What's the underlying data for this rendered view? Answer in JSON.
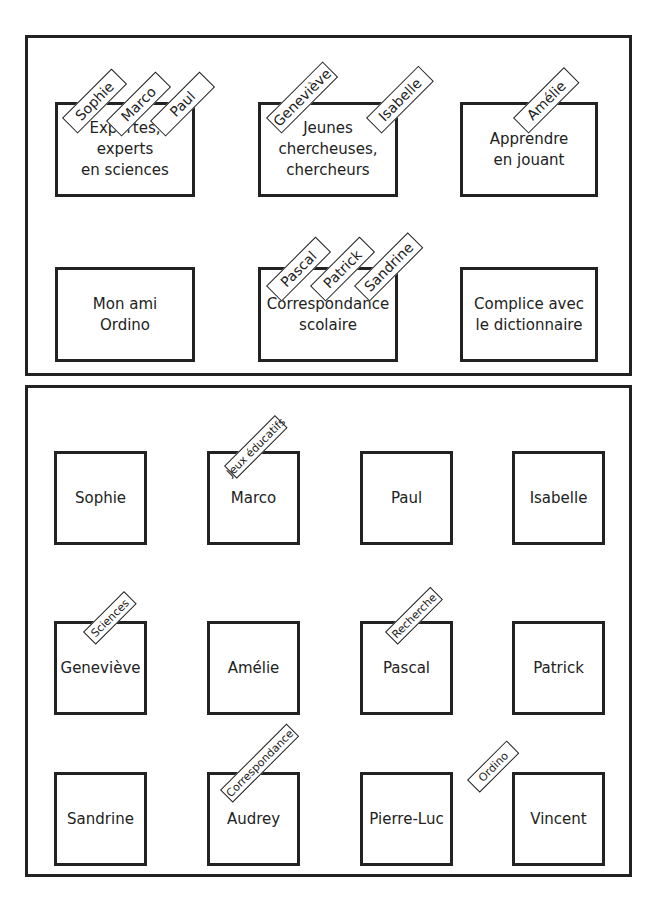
{
  "top_panel": {
    "groups": [
      {
        "label": "Expertes,\nexperts\nen sciences",
        "x": 55,
        "y": 102,
        "w": 140,
        "h": 95,
        "members": [
          {
            "name": "Sophie",
            "x": 62,
            "y": 102,
            "w": 70
          },
          {
            "name": "Marco",
            "x": 106,
            "y": 105,
            "w": 70
          },
          {
            "name": "Paul",
            "x": 150,
            "y": 105,
            "w": 70
          }
        ]
      },
      {
        "label": "Jeunes\nchercheuses,\nchercheurs",
        "x": 258,
        "y": 102,
        "w": 140,
        "h": 95,
        "members": [
          {
            "name": "Geneviève",
            "x": 266,
            "y": 102,
            "w": 80
          },
          {
            "name": "Isabelle",
            "x": 366,
            "y": 102,
            "w": 74
          }
        ]
      },
      {
        "label": "Apprendre\nen jouant",
        "x": 460,
        "y": 102,
        "w": 138,
        "h": 95,
        "members": [
          {
            "name": "Amélie",
            "x": 513,
            "y": 102,
            "w": 72
          }
        ]
      },
      {
        "label": "Mon ami\nOrdino",
        "x": 55,
        "y": 267,
        "w": 140,
        "h": 95,
        "members": []
      },
      {
        "label": "Correspondance\nscolaire",
        "x": 258,
        "y": 267,
        "w": 140,
        "h": 95,
        "members": [
          {
            "name": "Pascal",
            "x": 266,
            "y": 270,
            "w": 70
          },
          {
            "name": "Patrick",
            "x": 310,
            "y": 270,
            "w": 70
          },
          {
            "name": "Sandrine",
            "x": 354,
            "y": 270,
            "w": 76
          }
        ]
      },
      {
        "label": "Complice avec\nle dictionnaire",
        "x": 460,
        "y": 267,
        "w": 138,
        "h": 95,
        "members": []
      }
    ]
  },
  "bottom_panel": {
    "people": [
      {
        "name": "Sophie",
        "x": 54,
        "y": 451,
        "tag": null
      },
      {
        "name": "Marco",
        "x": 207,
        "y": 451,
        "tag": {
          "label": "Jeux éducatifs",
          "x": 224,
          "y": 466,
          "w": 72
        }
      },
      {
        "name": "Paul",
        "x": 360,
        "y": 451,
        "tag": null
      },
      {
        "name": "Isabelle",
        "x": 512,
        "y": 451,
        "tag": null
      },
      {
        "name": "Geneviève",
        "x": 54,
        "y": 621,
        "tag": {
          "label": "Sciences",
          "x": 83,
          "y": 632,
          "w": 58
        }
      },
      {
        "name": "Amélie",
        "x": 207,
        "y": 621,
        "tag": null
      },
      {
        "name": "Pascal",
        "x": 360,
        "y": 621,
        "tag": {
          "label": "Recherche",
          "x": 385,
          "y": 632,
          "w": 64
        }
      },
      {
        "name": "Patrick",
        "x": 512,
        "y": 621,
        "tag": null
      },
      {
        "name": "Sandrine",
        "x": 54,
        "y": 772,
        "tag": null
      },
      {
        "name": "Audrey",
        "x": 207,
        "y": 772,
        "tag": {
          "label": "Correspondance",
          "x": 220,
          "y": 790,
          "w": 94
        }
      },
      {
        "name": "Pierre-Luc",
        "x": 360,
        "y": 772,
        "tag": null
      },
      {
        "name": "Vincent",
        "x": 512,
        "y": 772,
        "tag": {
          "label": "Ordino",
          "x": 467,
          "y": 780,
          "w": 56
        }
      }
    ]
  }
}
